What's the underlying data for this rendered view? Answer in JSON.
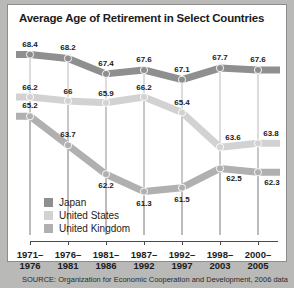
{
  "figure": {
    "title": "Average Age of Retirement in Select Countries",
    "source": "SOURCE: Organization for Economic Cooperation and Development, 2006 data"
  },
  "legend": {
    "position": "inside-bottom-left",
    "items": [
      {
        "label": "Japan",
        "color": "#8f8f8f"
      },
      {
        "label": "United States",
        "color": "#d2d2d2"
      },
      {
        "label": "United Kingdom",
        "color": "#b0b0b0"
      }
    ]
  },
  "chart_data": {
    "type": "line",
    "title": "Average Age of Retirement in Select Countries",
    "xlabel": "",
    "ylabel": "",
    "ylim": [
      60.5,
      69.0
    ],
    "grid": false,
    "categories": [
      "1971–1976",
      "1976–1981",
      "1981–1986",
      "1987–1992",
      "1992–1997",
      "1998–2003",
      "2000–2005"
    ],
    "series": [
      {
        "name": "Japan",
        "color": "#8f8f8f",
        "values": [
          68.4,
          68.2,
          67.4,
          67.6,
          67.1,
          67.7,
          67.6
        ]
      },
      {
        "name": "United States",
        "color": "#d2d2d2",
        "values": [
          66.2,
          66,
          65.9,
          66.2,
          65.4,
          63.6,
          63.8
        ]
      },
      {
        "name": "United Kingdom",
        "color": "#b0b0b0",
        "values": [
          65.2,
          63.7,
          62.2,
          61.3,
          61.5,
          62.5,
          62.3
        ]
      }
    ],
    "point_labels": {
      "Japan": [
        "68.4",
        "68.2",
        "67.4",
        "67.6",
        "67.1",
        "67.7",
        "67.6"
      ],
      "United States": [
        "66.2",
        "66",
        "65.9",
        "66.2",
        "65.4",
        "63.6",
        "63.8"
      ],
      "United Kingdom": [
        "65.2",
        "63.7",
        "62.2",
        "61.3",
        "61.5",
        "62.5",
        "62.3"
      ]
    },
    "xticklabels": [
      [
        "1971–",
        "1976"
      ],
      [
        "1976–",
        "1981"
      ],
      [
        "1981–",
        "1986"
      ],
      [
        "1987–",
        "1992"
      ],
      [
        "1992–",
        "1997"
      ],
      [
        "1998–",
        "2003"
      ],
      [
        "2000–",
        "2005"
      ]
    ]
  }
}
